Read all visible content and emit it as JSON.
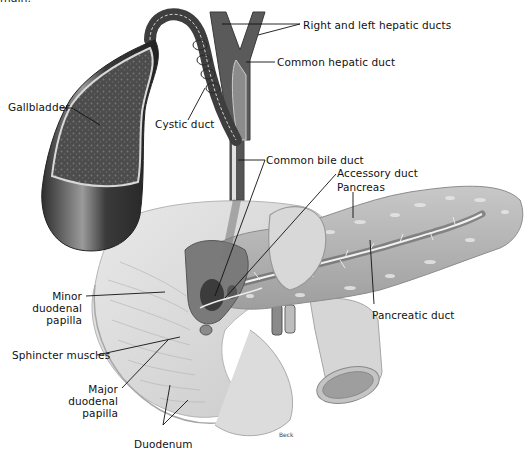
{
  "figure": {
    "cut_text": "main.",
    "signature": "Beck",
    "colors": {
      "background": "#ffffff",
      "ink": "#111111",
      "tissue_dark": "#4a4a4a",
      "tissue_mid": "#8c8c8c",
      "tissue_light": "#d4d4d4",
      "tissue_pale": "#e8e8e8"
    }
  },
  "labels": {
    "right_left_hepatic_ducts": "Right and left hepatic ducts",
    "common_hepatic_duct": "Common hepatic duct",
    "gallbladder": "Gallbladder",
    "cystic_duct": "Cystic duct",
    "common_bile_duct": "Common bile duct",
    "accessory_duct": "Accessory duct",
    "pancreas": "Pancreas",
    "minor_papilla_1": "Minor",
    "minor_papilla_2": "duodenal",
    "minor_papilla_3": "papilla",
    "sphincter_muscles": "Sphincter muscles",
    "pancreatic_duct": "Pancreatic duct",
    "major_papilla_1": "Major",
    "major_papilla_2": "duodenal",
    "major_papilla_3": "papilla",
    "duodenum": "Duodenum"
  }
}
